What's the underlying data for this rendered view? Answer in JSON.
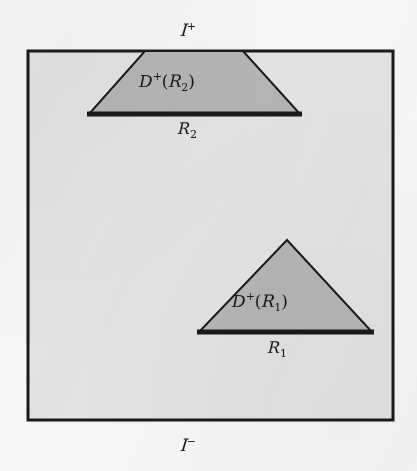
{
  "figure": {
    "background_color": "#f7f7f7",
    "ink_color": "#1a1a1a",
    "interior_fill": "#e2e2e2",
    "region_fill": "#b4b4b4"
  },
  "boundary_labels": {
    "future_null_infinity": {
      "script_letter": "I",
      "sign": "+",
      "full": "ℐ⁺",
      "position": "top-center-outside"
    },
    "past_null_infinity": {
      "script_letter": "I",
      "sign": "−",
      "full": "ℐ⁻",
      "position": "bottom-center-outside"
    }
  },
  "regions": [
    {
      "id": "upper",
      "domain_label": {
        "operator": "D",
        "sign": "+",
        "open_paren": "(",
        "set_letter": "R",
        "set_index": "2",
        "close_paren": ")",
        "full": "D⁺(ℛ₂)"
      },
      "slice_label": {
        "set_letter": "R",
        "set_index": "2",
        "full": "ℛ₂"
      },
      "shape": "trapezoid"
    },
    {
      "id": "lower",
      "domain_label": {
        "operator": "D",
        "sign": "+",
        "open_paren": "(",
        "set_letter": "R",
        "set_index": "1",
        "close_paren": ")",
        "full": "D⁺(ℛ₁)"
      },
      "slice_label": {
        "set_letter": "R",
        "set_index": "1",
        "full": "ℛ₁"
      },
      "shape": "triangle"
    }
  ],
  "geometry": {
    "box": {
      "x1": 28,
      "y1": 51,
      "x2": 393,
      "y2": 420,
      "stroke_width": 3
    },
    "upper_trapezoid": {
      "points": "145,51 243,51 300,114 89,114",
      "base_y": 114,
      "base_x1": 89,
      "base_x2": 300,
      "base_stroke_width": 5
    },
    "lower_triangle": {
      "points": "287,240 372,332 199,332",
      "base_y": 332,
      "base_x1": 199,
      "base_x2": 372,
      "base_stroke_width": 5
    }
  }
}
